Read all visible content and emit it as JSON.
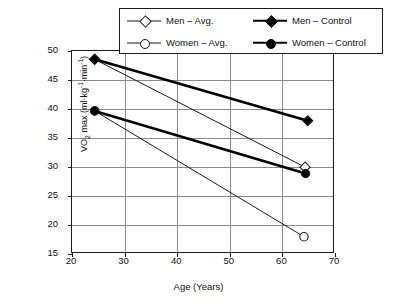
{
  "chart_data": {
    "type": "line",
    "title": "",
    "xlabel": "Age (Years)",
    "ylabel": "VO2 max (ml·kg-1·min-1)",
    "ylabel_parts": {
      "prefix": "VO",
      "sub": "2",
      "mid": " max (ml·kg",
      "sup1": "-1",
      "mid2": "·min",
      "sup2": "-1",
      "suffix": ")"
    },
    "xlim": [
      20,
      70
    ],
    "ylim": [
      15,
      50
    ],
    "xticks": [
      20,
      30,
      40,
      50,
      60,
      70
    ],
    "yticks": [
      15,
      20,
      25,
      30,
      35,
      40,
      45,
      50
    ],
    "grid": "both",
    "legend_position": "top-center",
    "series": [
      {
        "name": "Men – Avg.",
        "marker": "diamond-open",
        "line": "thin",
        "color": "#1a1a1a",
        "x": [
          24.5,
          64.5
        ],
        "y": [
          48.4,
          29.8
        ],
        "points": [
          {
            "x": 24.5,
            "y": 48.4
          },
          {
            "x": 64.5,
            "y": 29.8
          }
        ]
      },
      {
        "name": "Women – Avg.",
        "marker": "circle-open",
        "line": "thin",
        "color": "#1a1a1a",
        "x": [
          24.5,
          64.3
        ],
        "y": [
          39.5,
          17.8
        ],
        "points": [
          {
            "x": 24.5,
            "y": 39.5
          },
          {
            "x": 64.3,
            "y": 17.8
          }
        ]
      },
      {
        "name": "Men – Control",
        "marker": "diamond-filled",
        "line": "thick",
        "color": "#000000",
        "x": [
          24.5,
          65.0
        ],
        "y": [
          48.4,
          37.8
        ],
        "points": [
          {
            "x": 24.5,
            "y": 48.4
          },
          {
            "x": 65.0,
            "y": 37.8
          }
        ]
      },
      {
        "name": "Women – Control",
        "marker": "circle-filled",
        "line": "thick",
        "color": "#000000",
        "x": [
          24.5,
          64.6
        ],
        "y": [
          39.5,
          28.7
        ],
        "points": [
          {
            "x": 24.5,
            "y": 39.5
          },
          {
            "x": 64.6,
            "y": 28.7
          }
        ]
      }
    ]
  },
  "legend": {
    "entries": [
      {
        "label": "Men – Avg.",
        "marker": "diamond-open",
        "line": "thin"
      },
      {
        "label": "Men – Control",
        "marker": "diamond-filled",
        "line": "thick"
      },
      {
        "label": "Women – Avg.",
        "marker": "circle-open",
        "line": "thin"
      },
      {
        "label": "Women – Control",
        "marker": "circle-filled",
        "line": "thick"
      }
    ]
  },
  "axes": {
    "x_title": "Age (Years)",
    "x_tick_labels": [
      "20",
      "30",
      "40",
      "50",
      "60",
      "70"
    ],
    "y_tick_labels": [
      "15",
      "20",
      "25",
      "30",
      "35",
      "40",
      "45",
      "50"
    ]
  },
  "colors": {
    "axis": "#1a1a1a",
    "grid": "#8a8a8a",
    "thin_series": "#1a1a1a",
    "thick_series": "#000000",
    "background": "#ffffff"
  }
}
